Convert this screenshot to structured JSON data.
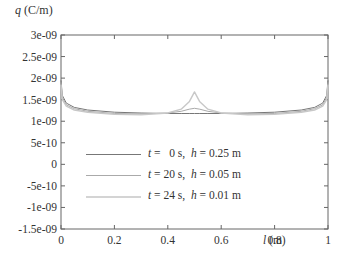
{
  "chart_data": {
    "type": "line",
    "title": "",
    "ylabel": "q (C/m)",
    "ylabel_var": "q",
    "ylabel_unit": "(C/m)",
    "xlabel": "l (m)",
    "xlabel_var": "l",
    "xlabel_unit": "(m)",
    "xlim": [
      0,
      1
    ],
    "ylim": [
      -1.5e-09,
      3e-09
    ],
    "grid": false,
    "legend_position": "lower-left inside",
    "x_ticks": [
      "0",
      "0.2",
      "0.4",
      "0.6",
      "0.8",
      "1"
    ],
    "y_ticks": [
      "3e-09",
      "2.5e-09",
      "2e-09",
      "1.5e-09",
      "1e-09",
      "5e-10",
      "0",
      "-5e-10",
      "-1e-09",
      "-1.5e-09"
    ],
    "x": [
      0,
      0.005,
      0.02,
      0.05,
      0.1,
      0.2,
      0.3,
      0.4,
      0.45,
      0.48,
      0.5,
      0.52,
      0.55,
      0.6,
      0.7,
      0.8,
      0.9,
      0.95,
      0.98,
      0.995,
      1
    ],
    "series": [
      {
        "name": "t = 0 s, h = 0.25 m",
        "t": "0 s",
        "h": "0.25 m",
        "color": "#777777",
        "values": [
          1.95e-09,
          1.6e-09,
          1.42e-09,
          1.32e-09,
          1.26e-09,
          1.21e-09,
          1.19e-09,
          1.18e-09,
          1.18e-09,
          1.18e-09,
          1.18e-09,
          1.18e-09,
          1.18e-09,
          1.18e-09,
          1.19e-09,
          1.21e-09,
          1.26e-09,
          1.32e-09,
          1.42e-09,
          1.6e-09,
          1.95e-09
        ]
      },
      {
        "name": "t = 20 s, h = 0.05 m",
        "t": "20 s",
        "h": "0.05 m",
        "color": "#aaaaaa",
        "values": [
          1.9e-09,
          1.55e-09,
          1.38e-09,
          1.29e-09,
          1.23e-09,
          1.18e-09,
          1.17e-09,
          1.19e-09,
          1.23e-09,
          1.28e-09,
          1.3e-09,
          1.28e-09,
          1.23e-09,
          1.19e-09,
          1.17e-09,
          1.18e-09,
          1.23e-09,
          1.29e-09,
          1.38e-09,
          1.55e-09,
          1.9e-09
        ]
      },
      {
        "name": "t = 24 s, h = 0.01 m",
        "t": "24 s",
        "h": "0.01 m",
        "color": "#c8c8c8",
        "values": [
          1.85e-09,
          1.5e-09,
          1.35e-09,
          1.26e-09,
          1.21e-09,
          1.16e-09,
          1.15e-09,
          1.19e-09,
          1.28e-09,
          1.45e-09,
          1.68e-09,
          1.45e-09,
          1.28e-09,
          1.19e-09,
          1.15e-09,
          1.16e-09,
          1.21e-09,
          1.26e-09,
          1.35e-09,
          1.5e-09,
          1.85e-09
        ]
      }
    ]
  },
  "legend": {
    "items": [
      {
        "t_prefix": "t",
        "t_val": " =   0 s,  ",
        "h_prefix": "h",
        "h_val": " = 0.25 m"
      },
      {
        "t_prefix": "t",
        "t_val": " = 20 s,  ",
        "h_prefix": "h",
        "h_val": " = 0.05 m"
      },
      {
        "t_prefix": "t",
        "t_val": " = 24 s,  ",
        "h_prefix": "h",
        "h_val": " = 0.01 m"
      }
    ]
  }
}
